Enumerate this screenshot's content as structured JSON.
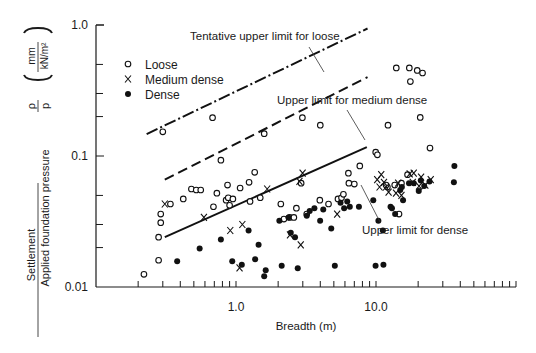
{
  "chart_data": {
    "type": "scatter",
    "title": "",
    "xlabel": "Breadth (m)",
    "ylabel_numerator": "Settlement",
    "ylabel_denominator": "Applied foundation pressure",
    "ylabel_symbol_num": "ρ",
    "ylabel_symbol_den": "p",
    "ylabel_units_num": "mm",
    "ylabel_units_den": "kN/m²",
    "x_scale": "log",
    "y_scale": "log",
    "xlim": [
      0.1,
      100
    ],
    "ylim": [
      0.01,
      1.0
    ],
    "x_tick_labels": [
      {
        "value": 1.0,
        "label": "1.0"
      },
      {
        "value": 10.0,
        "label": "10.0"
      }
    ],
    "y_tick_labels": [
      {
        "value": 1.0,
        "label": "1.0"
      },
      {
        "value": 0.1,
        "label": "0.1"
      },
      {
        "value": 0.01,
        "label": "0.01"
      }
    ],
    "grid": false,
    "legend": {
      "position": "top-left",
      "entries": [
        {
          "label": "Loose",
          "marker": "open-circle"
        },
        {
          "label": "Medium dense",
          "marker": "cross"
        },
        {
          "label": "Dense",
          "marker": "filled-circle"
        }
      ]
    },
    "lines": [
      {
        "name": "Tentative upper limit for loose",
        "style": "dash-dot",
        "points": [
          [
            0.23,
            0.147
          ],
          [
            8.7,
            0.94
          ]
        ]
      },
      {
        "name": "Upper limit for medium dense",
        "style": "dashed",
        "points": [
          [
            0.31,
            0.066
          ],
          [
            8.7,
            0.4
          ]
        ]
      },
      {
        "name": "Upper limit for dense",
        "style": "solid",
        "points": [
          [
            0.31,
            0.024
          ],
          [
            8.6,
            0.117
          ]
        ]
      }
    ],
    "annotations": [
      {
        "text": "Tentative upper limit for loose",
        "target_line": 0
      },
      {
        "text": "Upper limit for medium dense",
        "target_line": 1
      },
      {
        "text": "Upper limit for dense",
        "target_line": 2
      }
    ],
    "series": [
      {
        "name": "Loose",
        "marker": "open-circle",
        "points": [
          [
            0.22,
            0.0125
          ],
          [
            0.28,
            0.016
          ],
          [
            0.28,
            0.024
          ],
          [
            0.29,
            0.031
          ],
          [
            0.29,
            0.036
          ],
          [
            0.34,
            0.043
          ],
          [
            0.42,
            0.047
          ],
          [
            0.48,
            0.056
          ],
          [
            0.52,
            0.055
          ],
          [
            0.56,
            0.055
          ],
          [
            0.3,
            0.153
          ],
          [
            0.68,
            0.196
          ],
          [
            0.69,
            0.041
          ],
          [
            0.73,
            0.052
          ],
          [
            0.78,
            0.093
          ],
          [
            0.85,
            0.046
          ],
          [
            0.88,
            0.048
          ],
          [
            0.95,
            0.047
          ],
          [
            0.9,
            0.042
          ],
          [
            0.87,
            0.06
          ],
          [
            1.07,
            0.057
          ],
          [
            1.24,
            0.063
          ],
          [
            1.36,
            0.075
          ],
          [
            1.26,
            0.045
          ],
          [
            1.49,
            0.048
          ],
          [
            1.59,
            0.148
          ],
          [
            2.09,
            0.043
          ],
          [
            2.2,
            0.033
          ],
          [
            2.42,
            0.034
          ],
          [
            2.59,
            0.034
          ],
          [
            2.7,
            0.04
          ],
          [
            2.98,
            0.196
          ],
          [
            3.2,
            0.036
          ],
          [
            2.92,
            0.062
          ],
          [
            4.0,
            0.172
          ],
          [
            3.97,
            0.046
          ],
          [
            4.58,
            0.043
          ],
          [
            5.35,
            0.047
          ],
          [
            5.67,
            0.048
          ],
          [
            5.85,
            0.051
          ],
          [
            6.35,
            0.074
          ],
          [
            7.66,
            0.084
          ],
          [
            9.95,
            0.107
          ],
          [
            10.23,
            0.102
          ],
          [
            12.18,
            0.172
          ],
          [
            13.96,
            0.47
          ],
          [
            17.3,
            0.47
          ],
          [
            17.6,
            0.37
          ],
          [
            19.7,
            0.45
          ],
          [
            21.5,
            0.43
          ],
          [
            20.7,
            0.197
          ],
          [
            24.3,
            0.115
          ],
          [
            12.06,
            0.058
          ],
          [
            11.8,
            0.06
          ],
          [
            13.6,
            0.06
          ],
          [
            15.2,
            0.062
          ],
          [
            16.8,
            0.072
          ],
          [
            6.4,
            0.062
          ],
          [
            7.0,
            0.061
          ],
          [
            14.6,
            0.036
          ]
        ]
      },
      {
        "name": "Medium dense",
        "marker": "cross",
        "points": [
          [
            0.31,
            0.043
          ],
          [
            0.59,
            0.034
          ],
          [
            0.91,
            0.027
          ],
          [
            1.11,
            0.03
          ],
          [
            1.06,
            0.014
          ],
          [
            1.67,
            0.056
          ],
          [
            2.43,
            0.025
          ],
          [
            2.84,
            0.064
          ],
          [
            2.99,
            0.074
          ],
          [
            2.9,
            0.021
          ],
          [
            5.28,
            0.036
          ],
          [
            10.2,
            0.066
          ],
          [
            10.9,
            0.072
          ],
          [
            10.6,
            0.058
          ],
          [
            11.8,
            0.058
          ],
          [
            11.4,
            0.063
          ],
          [
            12.3,
            0.053
          ],
          [
            13.9,
            0.052
          ],
          [
            14.4,
            0.062
          ],
          [
            15.2,
            0.05
          ],
          [
            17.4,
            0.073
          ],
          [
            18.6,
            0.074
          ],
          [
            18.3,
            0.063
          ],
          [
            20.3,
            0.059
          ],
          [
            21.0,
            0.069
          ],
          [
            22.5,
            0.06
          ],
          [
            24.6,
            0.066
          ]
        ]
      },
      {
        "name": "Dense",
        "marker": "filled-circle",
        "points": [
          [
            0.38,
            0.0157
          ],
          [
            0.55,
            0.0197
          ],
          [
            0.78,
            0.023
          ],
          [
            0.94,
            0.0157
          ],
          [
            1.1,
            0.0148
          ],
          [
            1.23,
            0.027
          ],
          [
            1.37,
            0.0163
          ],
          [
            1.45,
            0.021
          ],
          [
            1.59,
            0.0121
          ],
          [
            1.63,
            0.0134
          ],
          [
            2.04,
            0.032
          ],
          [
            2.12,
            0.0145
          ],
          [
            2.37,
            0.034
          ],
          [
            2.46,
            0.026
          ],
          [
            2.64,
            0.024
          ],
          [
            2.76,
            0.0139
          ],
          [
            3.2,
            0.035
          ],
          [
            3.36,
            0.038
          ],
          [
            3.63,
            0.04
          ],
          [
            3.99,
            0.032
          ],
          [
            4.2,
            0.039
          ],
          [
            4.79,
            0.028
          ],
          [
            5.08,
            0.0145
          ],
          [
            5.58,
            0.044
          ],
          [
            5.92,
            0.04
          ],
          [
            6.23,
            0.045
          ],
          [
            6.5,
            0.041
          ],
          [
            7.55,
            0.041
          ],
          [
            9.56,
            0.046
          ],
          [
            9.93,
            0.0145
          ],
          [
            10.4,
            0.032
          ],
          [
            11.3,
            0.0148
          ],
          [
            11.2,
            0.027
          ],
          [
            12.7,
            0.041
          ],
          [
            13.0,
            0.04
          ],
          [
            13.7,
            0.036
          ],
          [
            14.9,
            0.055
          ],
          [
            15.3,
            0.058
          ],
          [
            15.6,
            0.046
          ],
          [
            17.2,
            0.062
          ],
          [
            18.6,
            0.062
          ],
          [
            20.2,
            0.054
          ],
          [
            20.9,
            0.065
          ],
          [
            22.1,
            0.059
          ],
          [
            24.1,
            0.064
          ],
          [
            36.3,
            0.084
          ],
          [
            36.0,
            0.063
          ]
        ]
      }
    ]
  }
}
